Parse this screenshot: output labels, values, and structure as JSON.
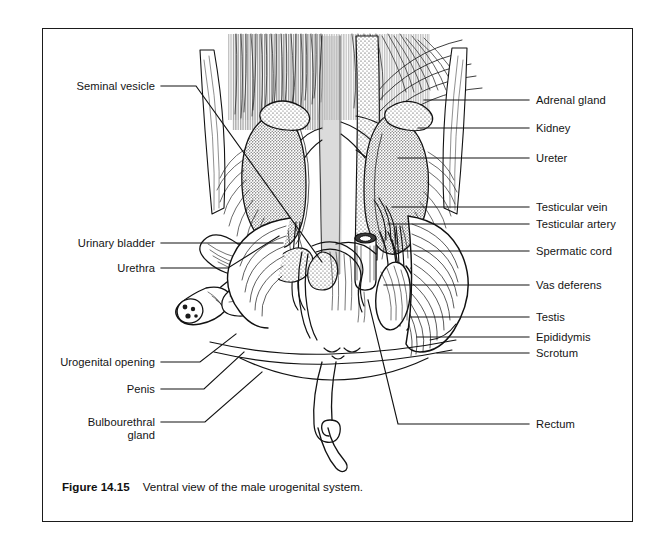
{
  "figure": {
    "number_label": "Figure 14.15",
    "caption_text": "Ventral view of the male urogenital system.",
    "frame_color": "#1b1b1b",
    "background_color": "#ffffff",
    "ink_color": "#141414"
  },
  "illustration": {
    "subject": "male-urogenital-system-ventral-dissection",
    "style": "pen-and-ink-stipple-line-drawing",
    "structures_depicted": [
      "kidney-left",
      "kidney-right",
      "adrenal-gland-left",
      "adrenal-gland-right",
      "abdominal-aorta",
      "caudal-vena-cava",
      "ureter-left",
      "ureter-right",
      "urinary-bladder",
      "urethra",
      "penis-cross-section",
      "bulbourethral-gland",
      "seminal-vesicle",
      "vas-deferens",
      "spermatic-cord",
      "testicular-vein",
      "testicular-artery",
      "testis",
      "epididymis",
      "scrotum",
      "rectum",
      "tail"
    ]
  },
  "labels_left": [
    {
      "text": "Seminal vesicle",
      "name": "label-seminal-vesicle"
    },
    {
      "text": "Urinary bladder",
      "name": "label-urinary-bladder"
    },
    {
      "text": "Urethra",
      "name": "label-urethra"
    },
    {
      "text": "Urogenital opening",
      "name": "label-urogenital-opening"
    },
    {
      "text": "Penis",
      "name": "label-penis"
    },
    {
      "text": "Bulbourethral",
      "name": "label-bulbourethral-gland-line1"
    },
    {
      "text": "gland",
      "name": "label-bulbourethral-gland-line2"
    }
  ],
  "labels_right": [
    {
      "text": "Adrenal gland",
      "name": "label-adrenal-gland"
    },
    {
      "text": "Kidney",
      "name": "label-kidney"
    },
    {
      "text": "Ureter",
      "name": "label-ureter"
    },
    {
      "text": "Testicular vein",
      "name": "label-testicular-vein"
    },
    {
      "text": "Testicular artery",
      "name": "label-testicular-artery"
    },
    {
      "text": "Spermatic cord",
      "name": "label-spermatic-cord"
    },
    {
      "text": "Vas deferens",
      "name": "label-vas-deferens"
    },
    {
      "text": "Testis",
      "name": "label-testis"
    },
    {
      "text": "Epididymis",
      "name": "label-epididymis"
    },
    {
      "text": "Scrotum",
      "name": "label-scrotum"
    },
    {
      "text": "Rectum",
      "name": "label-rectum"
    }
  ]
}
